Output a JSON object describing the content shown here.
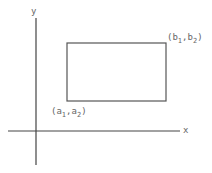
{
  "diagram": {
    "type": "coordinate-rectangle",
    "axes": {
      "x_label": "x",
      "y_label": "y",
      "origin_px": [
        36,
        131
      ],
      "x_axis_px": {
        "x1": 8,
        "x2": 180,
        "y": 131
      },
      "y_axis_px": {
        "x": 36,
        "y1": 18,
        "y2": 165
      }
    },
    "rectangle": {
      "top_left_px": [
        67,
        43
      ],
      "bottom_right_px": [
        166,
        101
      ],
      "stroke": "#555555"
    },
    "points": {
      "lower_left": {
        "open": "(a",
        "sub1": "1",
        "mid": ",a",
        "sub2": "2",
        "close": ")"
      },
      "upper_right": {
        "open": "(b",
        "sub1": "1",
        "mid": ",b",
        "sub2": "2",
        "close": ")"
      }
    },
    "colors": {
      "axis": "#444444",
      "rect": "#555555",
      "text": "#666666"
    }
  }
}
